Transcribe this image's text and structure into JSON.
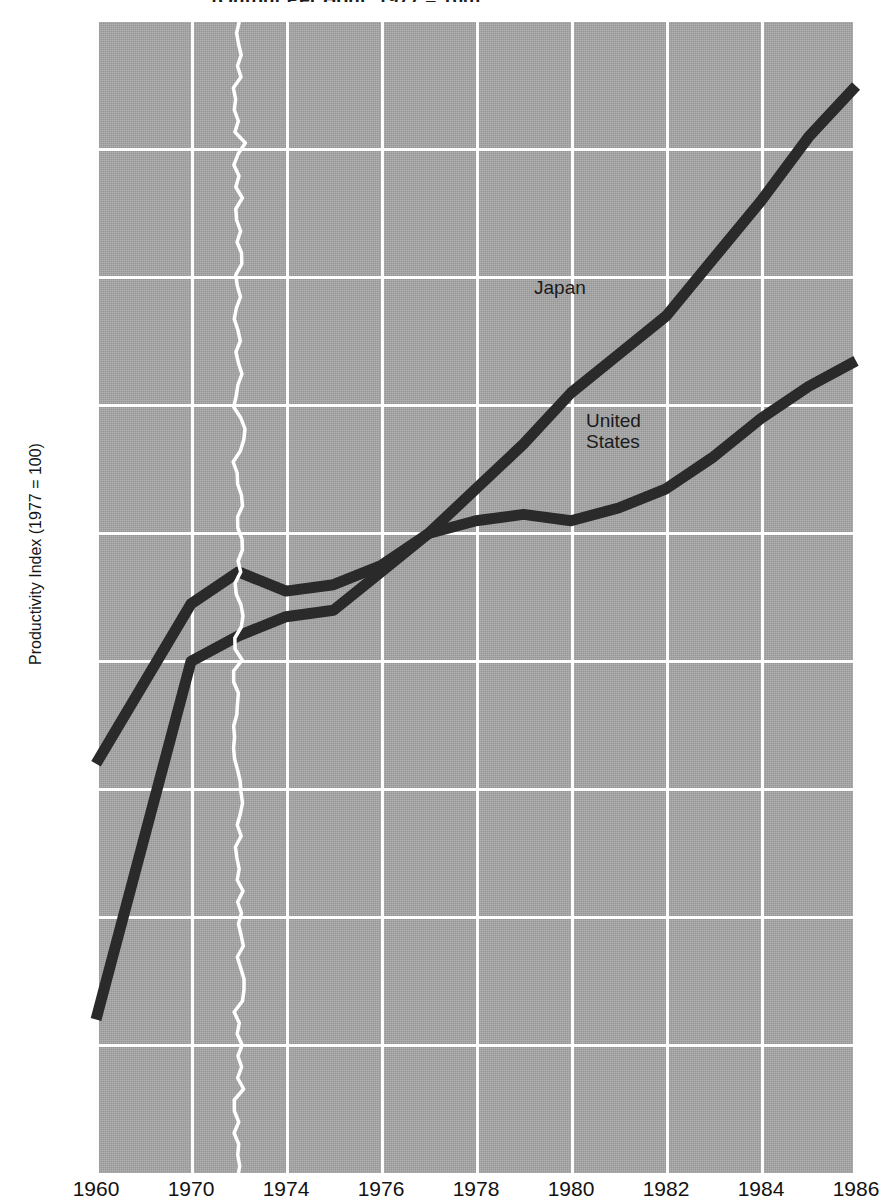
{
  "chart": {
    "title": "(Output Per Hour, 1977 = 100)",
    "ylabel": "Productivity Index (1977 = 100)",
    "xlabel": "",
    "series_labels": {
      "japan": "Japan",
      "united_states": "United\nStates"
    },
    "colors": {
      "plot_background": "#a8a8a8",
      "gridline": "#fdfdfd",
      "line": "#2a2a2a",
      "axis_break": "#ffffff",
      "text": "#121212"
    }
  },
  "chart_data": {
    "type": "line",
    "title": "(Output Per Hour, 1977 = 100)",
    "subtitle": "",
    "xlabel": "",
    "ylabel": "Productivity Index (1977 = 100)",
    "ylim": [
      0,
      180
    ],
    "yticks": [
      0,
      20,
      40,
      60,
      80,
      100,
      120,
      140,
      160,
      180
    ],
    "xticks": [
      1960,
      1970,
      1974,
      1976,
      1978,
      1980,
      1982,
      1984,
      1986
    ],
    "grid": true,
    "legend_position": "inline-annotation",
    "axis_break": {
      "present": true,
      "style": "wavy-vertical-white-line",
      "between": [
        1970,
        1974
      ],
      "at_x": 1972
    },
    "annotations": [
      {
        "text": "Japan",
        "x": 1977.3,
        "y": 138
      },
      {
        "text": "United States",
        "x": 1978.0,
        "y": 116
      }
    ],
    "series": [
      {
        "name": "Japan",
        "x": [
          1960,
          1970,
          1972,
          1974,
          1975,
          1976,
          1977,
          1978,
          1979,
          1980,
          1981,
          1982,
          1983,
          1984,
          1985,
          1986
        ],
        "values": [
          24,
          80,
          84,
          87,
          88,
          94,
          100,
          107,
          114,
          122,
          128,
          134,
          143,
          152,
          162,
          170
        ]
      },
      {
        "name": "United States",
        "x": [
          1960,
          1970,
          1972,
          1974,
          1975,
          1976,
          1977,
          1978,
          1979,
          1980,
          1981,
          1982,
          1983,
          1984,
          1985,
          1986
        ],
        "values": [
          64,
          89,
          94,
          91,
          92,
          95,
          100,
          102,
          103,
          102,
          104,
          107,
          112,
          118,
          123,
          127
        ]
      }
    ]
  },
  "yticks": [
    {
      "label": "180",
      "value": 180
    },
    {
      "label": "160",
      "value": 160
    },
    {
      "label": "140",
      "value": 140
    },
    {
      "label": "120",
      "value": 120
    },
    {
      "label": "100",
      "value": 100
    },
    {
      "label": "80",
      "value": 80
    },
    {
      "label": "60",
      "value": 60
    },
    {
      "label": "40",
      "value": 40
    },
    {
      "label": "20",
      "value": 20
    },
    {
      "label": "0",
      "value": 0
    }
  ],
  "xticks": [
    {
      "label": "1960",
      "value": 1960
    },
    {
      "label": "1970",
      "value": 1970
    },
    {
      "label": "1974",
      "value": 1974
    },
    {
      "label": "1976",
      "value": 1976
    },
    {
      "label": "1978",
      "value": 1978
    },
    {
      "label": "1980",
      "value": 1980
    },
    {
      "label": "1982",
      "value": 1982
    },
    {
      "label": "1984",
      "value": 1984
    },
    {
      "label": "1986",
      "value": 1986
    }
  ]
}
